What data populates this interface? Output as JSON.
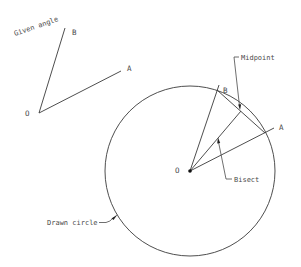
{
  "given_angle": {
    "title": "Given angle",
    "vertex_label": "O",
    "ray_a_label": "A",
    "ray_b_label": "B"
  },
  "construction": {
    "vertex_label": "O",
    "ray_a_label": "A",
    "ray_b_label": "B",
    "callouts": {
      "midpoint": "Midpoint",
      "bisect": "Bisect",
      "circle": "Drawn circle"
    }
  },
  "colors": {
    "line": "#3a3a3a",
    "text": "#4a4a4a",
    "background": "#ffffff"
  }
}
